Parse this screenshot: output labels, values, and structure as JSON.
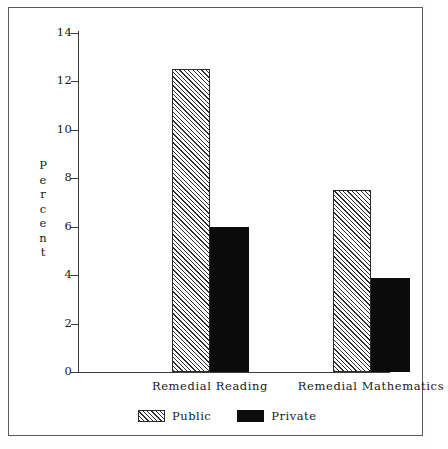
{
  "chart_data": {
    "type": "bar",
    "title": "",
    "subtitle": "",
    "xlabel": "",
    "ylabel": "Percent",
    "categories": [
      "Remedial Reading",
      "Remedial Mathematics"
    ],
    "series": [
      {
        "name": "Public",
        "values": [
          12.5,
          7.5
        ],
        "pattern": "diagonal-hatch",
        "color": "#ffffff"
      },
      {
        "name": "Private",
        "values": [
          6.0,
          3.9
        ],
        "pattern": "solid",
        "color": "#0b0b0b"
      }
    ],
    "ylim": [
      0,
      14
    ],
    "yticks": [
      0,
      2,
      4,
      6,
      8,
      10,
      12,
      14
    ],
    "ytick_labels": [
      "0",
      "2",
      "4",
      "6",
      "8",
      "10",
      "12",
      "14"
    ],
    "grid": false,
    "legend_position": "bottom",
    "frame": true
  },
  "axis": {
    "y_title_letters": [
      "P",
      "e",
      "r",
      "c",
      "e",
      "n",
      "t"
    ]
  },
  "legend": {
    "entries": [
      {
        "label": "Public",
        "swatch": "hatch-swatch"
      },
      {
        "label": "Private",
        "swatch": "solid-swatch"
      }
    ]
  }
}
